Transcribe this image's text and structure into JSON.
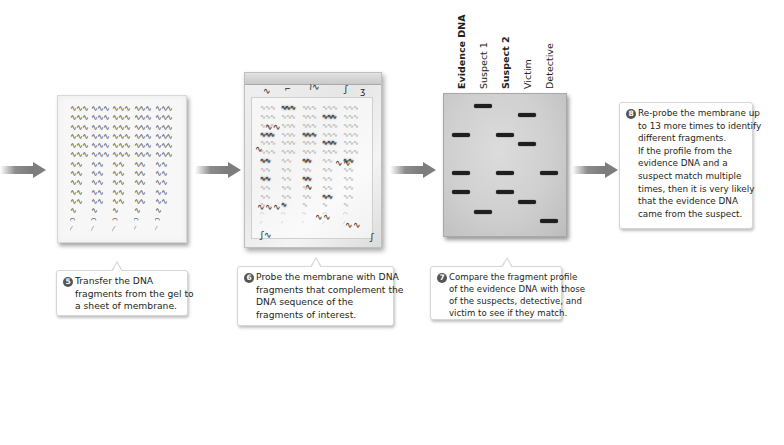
{
  "steps": [
    {
      "number": "5",
      "lines": [
        "Transfer the DNA",
        "fragments from the gel to",
        "a sheet of membrane."
      ]
    },
    {
      "number": "6",
      "lines": [
        "Probe the membrane with DNA",
        "fragments that complement the",
        "DNA sequence of the",
        "fragments of interest."
      ]
    },
    {
      "number": "7",
      "lines": [
        "Compare the fragment profile",
        "of the evidence DNA with those",
        "of the suspects, detective, and",
        "victim to see if they match."
      ]
    },
    {
      "number": "8",
      "lines": [
        "Re-probe the membrane up",
        "to 13 more times to identify",
        "different fragments.",
        "If the profile from the",
        "evidence DNA and a",
        "suspect match multiple",
        "times, then it is very likely",
        "that the evidence DNA",
        "came from the suspect."
      ]
    }
  ],
  "gel": {
    "lanes": [
      {
        "label": "Evidence DNA",
        "bold": true
      },
      {
        "label": "Suspect 1",
        "bold": false
      },
      {
        "label": "Suspect 2",
        "bold": true
      },
      {
        "label": "Victim",
        "bold": false
      },
      {
        "label": "Detective",
        "bold": false
      }
    ],
    "bands": [
      {
        "lane": 1,
        "y": 10
      },
      {
        "lane": 3,
        "y": 19
      },
      {
        "lane": 0,
        "y": 39
      },
      {
        "lane": 2,
        "y": 39
      },
      {
        "lane": 3,
        "y": 48
      },
      {
        "lane": 0,
        "y": 77
      },
      {
        "lane": 2,
        "y": 77
      },
      {
        "lane": 4,
        "y": 77
      },
      {
        "lane": 0,
        "y": 96
      },
      {
        "lane": 2,
        "y": 96
      },
      {
        "lane": 3,
        "y": 106
      },
      {
        "lane": 1,
        "y": 116
      },
      {
        "lane": 4,
        "y": 125
      }
    ]
  },
  "membrane_rows": [
    "∿∿∿",
    "∿∿∿",
    "∿∿∿",
    "∿∿∿",
    "∿∿∿",
    "∿∿∿",
    "∿∿",
    "∿∿",
    "∿∿",
    "∿∿",
    "∿∿",
    "∿",
    "⌒",
    "⁄"
  ],
  "icons": {
    "arrow": "right-arrow-icon",
    "badge": "step-number-badge"
  },
  "colors": {
    "arrow": "#7d7d7d",
    "badge": "#555555",
    "band": "#1f1f1f",
    "gel": "#cfcfcf"
  }
}
